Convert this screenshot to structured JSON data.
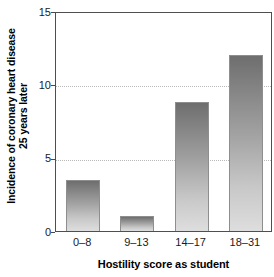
{
  "chart_data": {
    "type": "bar",
    "title": "",
    "xlabel": "Hostility score as student",
    "ylabel": "Incidence of coronary heart disease\n25 years later",
    "categories": [
      "0–8",
      "9–13",
      "14–17",
      "18–31"
    ],
    "values": [
      3.5,
      1.0,
      8.8,
      12.0
    ],
    "ylim": [
      0,
      15
    ],
    "yticks": [
      "0",
      "5",
      "10",
      "15"
    ],
    "ytick_values": [
      0,
      5,
      10,
      15
    ],
    "gridlines": [
      5,
      10
    ],
    "grid": "horizontal-dotted-at-5-and-10",
    "legend": "none",
    "bar_style": {
      "fill": "vertical-gradient-dark-top-to-light-bottom",
      "top_color": "#6e6e6e",
      "bottom_color": "#dedede",
      "border_color": "#8e8e8e"
    },
    "axis_color": "#4f4f4f",
    "grid_color": "#b9b9b9"
  }
}
